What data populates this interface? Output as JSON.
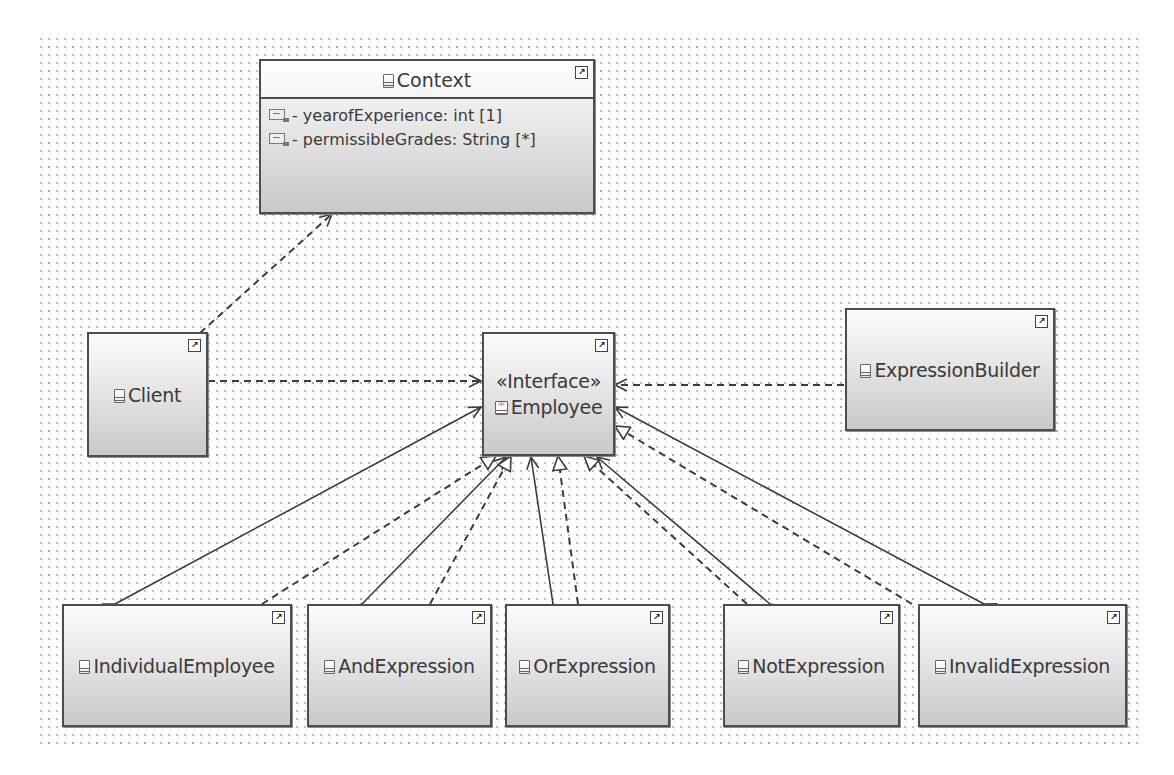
{
  "diagram": {
    "type": "UML class diagram",
    "colors": {
      "node_border": "#4d4d4d",
      "node_fill_top": "#fbfbfb",
      "node_fill_bottom": "#c9c9c9",
      "edge": "#3c3c3c",
      "grid_dot": "#9a9a9a",
      "background": "#ffffff"
    }
  },
  "nodes": {
    "context": {
      "name": "Context",
      "icon": "class-icon",
      "attributes": [
        {
          "icon": "attribute-icon",
          "text": "- yearofExperience: int [1]"
        },
        {
          "icon": "attribute-icon",
          "text": "- permissibleGrades: String [*]"
        }
      ]
    },
    "client": {
      "name": "Client",
      "icon": "class-icon"
    },
    "employee": {
      "stereotype": "«Interface»",
      "name": "Employee",
      "icon": "interface-icon"
    },
    "expression_builder": {
      "name": "ExpressionBuilder",
      "icon": "class-icon"
    },
    "individual_employee": {
      "name": "IndividualEmployee",
      "icon": "class-icon"
    },
    "and_expression": {
      "name": "AndExpression",
      "icon": "class-icon"
    },
    "or_expression": {
      "name": "OrExpression",
      "icon": "class-icon"
    },
    "not_expression": {
      "name": "NotExpression",
      "icon": "class-icon"
    },
    "invalid_expression": {
      "name": "InvalidExpression",
      "icon": "class-icon"
    }
  },
  "shortcut_glyph": "↗",
  "edges": [
    {
      "from": "Client",
      "to": "Context",
      "kind": "dependency"
    },
    {
      "from": "Client",
      "to": "Employee",
      "kind": "dependency"
    },
    {
      "from": "ExpressionBuilder",
      "to": "Employee",
      "kind": "dependency"
    },
    {
      "from": "IndividualEmployee",
      "to": "Employee",
      "kind": "realization"
    },
    {
      "from": "IndividualEmployee",
      "to": "Employee",
      "kind": "aggregation"
    },
    {
      "from": "AndExpression",
      "to": "Employee",
      "kind": "realization"
    },
    {
      "from": "AndExpression",
      "to": "Employee",
      "kind": "aggregation"
    },
    {
      "from": "OrExpression",
      "to": "Employee",
      "kind": "realization"
    },
    {
      "from": "OrExpression",
      "to": "Employee",
      "kind": "aggregation"
    },
    {
      "from": "NotExpression",
      "to": "Employee",
      "kind": "realization"
    },
    {
      "from": "NotExpression",
      "to": "Employee",
      "kind": "aggregation"
    },
    {
      "from": "InvalidExpression",
      "to": "Employee",
      "kind": "realization"
    },
    {
      "from": "InvalidExpression",
      "to": "Employee",
      "kind": "aggregation"
    }
  ]
}
